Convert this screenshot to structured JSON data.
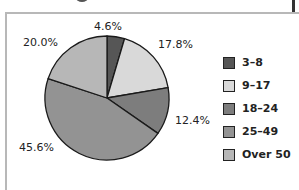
{
  "chart_data": {
    "type": "pie",
    "title": "",
    "categories": [
      "3–8",
      "9–17",
      "18–24",
      "25–49",
      "Over 50"
    ],
    "values": [
      4.6,
      17.8,
      12.4,
      45.6,
      20.0
    ],
    "value_labels": [
      "4.6%",
      "17.8%",
      "12.4%",
      "45.6%",
      "20.0%"
    ],
    "colors": [
      "#565656",
      "#d9d9d9",
      "#7d7d7d",
      "#939393",
      "#b7b7b7"
    ],
    "start_angle": "12 o'clock",
    "direction": "clockwise",
    "legend_position": "right"
  },
  "legend": {
    "items": [
      {
        "label": "3–8",
        "color": "#565656"
      },
      {
        "label": "9–17",
        "color": "#d9d9d9"
      },
      {
        "label": "18–24",
        "color": "#7d7d7d"
      },
      {
        "label": "25–49",
        "color": "#939393"
      },
      {
        "label": "Over 50",
        "color": "#b7b7b7"
      }
    ]
  },
  "slice_labels": [
    "4.6%",
    "17.8%",
    "12.4%",
    "45.6%",
    "20.0%"
  ]
}
